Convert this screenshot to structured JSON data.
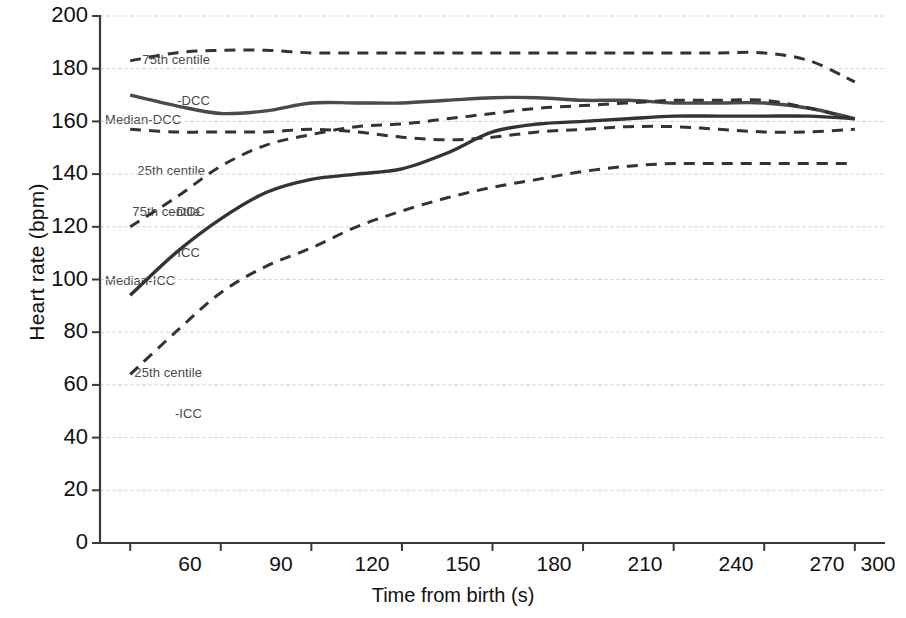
{
  "chart_data": {
    "type": "line",
    "title": "",
    "xlabel": "Time from birth (s)",
    "ylabel": "Heart rate (bpm)",
    "xlim": [
      50,
      310
    ],
    "ylim": [
      0,
      200
    ],
    "xticks": [
      "60",
      "90",
      "120",
      "150",
      "180",
      "210",
      "240",
      "270",
      "300"
    ],
    "yticks": [
      "0",
      "20",
      "40",
      "60",
      "80",
      "100",
      "120",
      "140",
      "160",
      "180",
      "200"
    ],
    "grid": "horizontal",
    "legend_position": "inline-annotations",
    "x": [
      60,
      75,
      90,
      105,
      120,
      135,
      150,
      165,
      180,
      195,
      210,
      225,
      240,
      255,
      270,
      285,
      300
    ],
    "series": [
      {
        "name": "75th centile -DCC",
        "style": "dashed",
        "color": "#333333",
        "values": [
          183,
          186,
          187,
          187,
          186,
          186,
          186,
          186,
          186,
          186,
          186,
          186,
          186,
          186,
          186,
          183,
          175
        ]
      },
      {
        "name": "Median-DCC",
        "style": "solid",
        "color": "#4a4a4a",
        "values": [
          170,
          166,
          163,
          164,
          167,
          167,
          167,
          168,
          169,
          169,
          168,
          168,
          167,
          167,
          167,
          165,
          161
        ]
      },
      {
        "name": "25th centile -DCC",
        "style": "dashed",
        "color": "#333333",
        "values": [
          157,
          156,
          156,
          156,
          157,
          156,
          154,
          153,
          154,
          156,
          157,
          158,
          158,
          157,
          156,
          156,
          157
        ]
      },
      {
        "name": "75th centile -ICC",
        "style": "dashed",
        "color": "#333333",
        "values": [
          120,
          131,
          143,
          151,
          155,
          158,
          159,
          161,
          163,
          165,
          166,
          167,
          168,
          168,
          168,
          165,
          161
        ]
      },
      {
        "name": "Median-ICC",
        "style": "solid",
        "color": "#333333",
        "values": [
          94,
          110,
          123,
          133,
          138,
          140,
          142,
          148,
          156,
          159,
          160,
          161,
          162,
          162,
          162,
          162,
          161
        ]
      },
      {
        "name": "25th centile -ICC",
        "style": "dashed",
        "color": "#333333",
        "values": [
          64,
          80,
          95,
          105,
          112,
          120,
          126,
          131,
          135,
          138,
          141,
          143,
          144,
          144,
          144,
          144,
          144
        ]
      }
    ],
    "annotations": [
      {
        "id": "ann-75-dcc",
        "line1": "75th centile",
        "line2": "-DCC",
        "align": "right"
      },
      {
        "id": "ann-median-dcc",
        "line1": "Median-DCC",
        "line2": "",
        "align": "left"
      },
      {
        "id": "ann-25-dcc",
        "line1": "25th centile",
        "line2": "-DCC",
        "align": "right"
      },
      {
        "id": "ann-75-icc",
        "line1": "75th centile",
        "line2": "-ICC",
        "align": "right"
      },
      {
        "id": "ann-median-icc",
        "line1": "Median-ICC",
        "line2": "",
        "align": "left"
      },
      {
        "id": "ann-25-icc",
        "line1": "25th centile",
        "line2": "-ICC",
        "align": "right"
      }
    ]
  },
  "axes": {
    "y_label": "Heart rate (bpm)",
    "x_label": "Time from birth (s)",
    "y_ticks": [
      "200",
      "180",
      "160",
      "140",
      "120",
      "100",
      "80",
      "60",
      "40",
      "20",
      "0"
    ],
    "x_ticks": [
      "60",
      "90",
      "120",
      "150",
      "180",
      "210",
      "240",
      "270",
      "300"
    ]
  },
  "annotations": {
    "a0_l1": "75th centile",
    "a0_l2": "-DCC",
    "a1_l1": "Median-DCC",
    "a2_l1": "25th centile",
    "a2_l2": "-DCC",
    "a3_l1": "75th centile",
    "a3_l2": "-ICC",
    "a4_l1": "Median-ICC",
    "a5_l1": "25th centile",
    "a5_l2": "-ICC"
  }
}
